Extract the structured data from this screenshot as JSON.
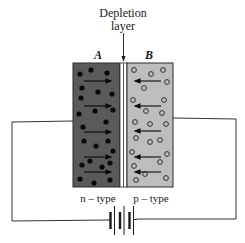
{
  "title": {
    "line1": "Depletion",
    "line2": "layer"
  },
  "regions": {
    "left": {
      "letter": "A",
      "type_label": "n – type",
      "fill": "#5a5a5a",
      "carrier": "filled-dot",
      "arrow_direction": "right"
    },
    "right": {
      "letter": "B",
      "type_label": "p – type",
      "fill": "#bdbdbd",
      "carrier": "hollow-circle",
      "arrow_direction": "left"
    }
  },
  "components": {
    "battery": "battery-icon",
    "wire_color": "#333333"
  },
  "colors": {
    "n_region": "#5a5a5a",
    "p_region": "#bdbdbd",
    "depletion": "#ffffff",
    "ink": "#1a1a1a"
  }
}
